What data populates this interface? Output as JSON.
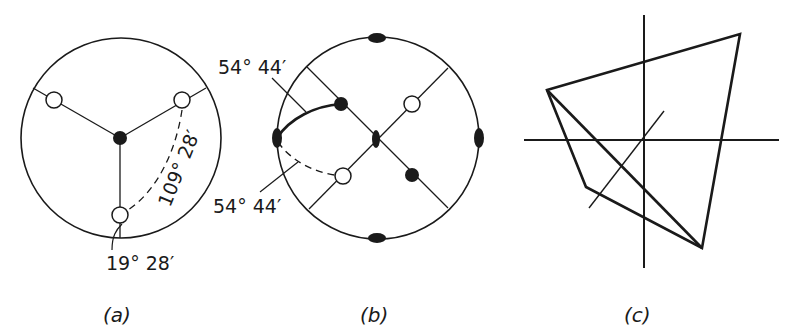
{
  "figure": {
    "panels": [
      {
        "id": "a",
        "caption": "(a)",
        "annotations": [
          {
            "text": "109° 28′",
            "kind": "angle-label",
            "meaning": "angle between two open poles"
          },
          {
            "text": "19° 28′",
            "kind": "angle-label",
            "meaning": "lower pole offset from primitive circle"
          }
        ],
        "elements": {
          "primitive_circle": true,
          "center_symbol": "filled-dot",
          "poles_open": 3,
          "great_circle_traces": 3,
          "dashed_arc": true
        }
      },
      {
        "id": "b",
        "caption": "(b)",
        "annotations": [
          {
            "text": "54° 44′",
            "kind": "angle-label",
            "position": "upper-left"
          },
          {
            "text": "54° 44′",
            "kind": "angle-label",
            "position": "lower-left"
          }
        ],
        "elements": {
          "primitive_circle": true,
          "twofold_axes_on_rim": 4,
          "twofold_axis_center": 1,
          "poles_filled": 2,
          "poles_open": 2,
          "diagonal_traces": 2,
          "solid_arc": true,
          "dashed_arc": true
        }
      },
      {
        "id": "c",
        "caption": "(c)",
        "annotations": [],
        "elements": {
          "axes": [
            "vertical",
            "horizontal",
            "oblique"
          ],
          "shape": "tetrahedron-outline"
        }
      }
    ],
    "colors": {
      "ink": "#1a1a1a",
      "background": "#ffffff"
    }
  }
}
